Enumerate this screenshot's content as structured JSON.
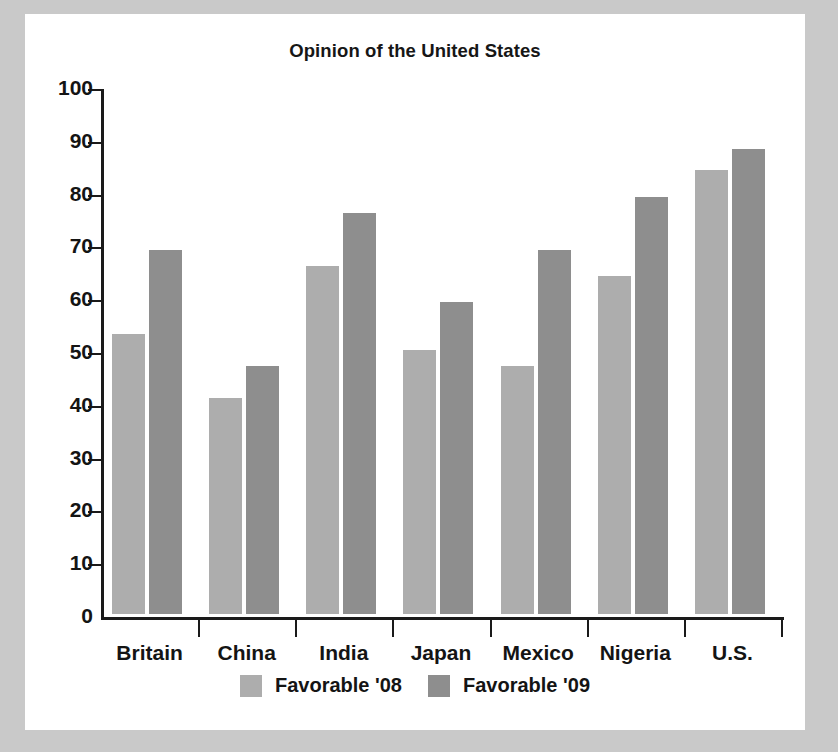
{
  "chart_data": {
    "type": "bar",
    "title": "Opinion of the United States",
    "xlabel": "",
    "ylabel": "",
    "ylim": [
      0,
      100
    ],
    "yticks": [
      0,
      10,
      20,
      30,
      40,
      50,
      60,
      70,
      80,
      90,
      100
    ],
    "grid": false,
    "legend_position": "bottom-center",
    "categories": [
      "Britain",
      "China",
      "India",
      "Japan",
      "Mexico",
      "Nigeria",
      "U.S."
    ],
    "series": [
      {
        "name": "Favorable '08",
        "color": "#adadad",
        "values": [
          53,
          41,
          66,
          50,
          47,
          64,
          84
        ]
      },
      {
        "name": "Favorable '09",
        "color": "#8e8e8e",
        "values": [
          69,
          47,
          76,
          59,
          69,
          79,
          88
        ]
      }
    ]
  },
  "colors": {
    "page_background": "#c9c9c9",
    "card_background": "#ffffff",
    "axis": "#1a1a1a",
    "text": "#141414"
  }
}
